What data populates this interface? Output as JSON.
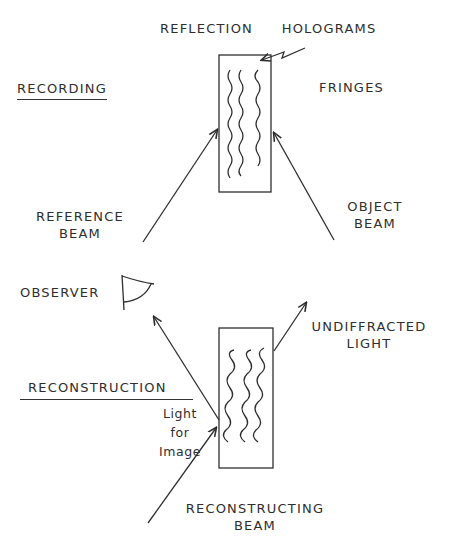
{
  "title": "REFLECTION HOLOGRAMS",
  "title_parts": [
    "REFLECTION",
    "HOLOGRAMS"
  ],
  "recording": {
    "heading": "RECORDING",
    "fringes_label": "FRINGES",
    "reference_beam": [
      "REFERENCE",
      "BEAM"
    ],
    "object_beam": [
      "OBJECT",
      "BEAM"
    ]
  },
  "reconstruction": {
    "heading": "RECONSTRUCTION",
    "observer_label": "OBSERVER",
    "undiffracted_light": [
      "UNDIFFRACTED",
      "LIGHT"
    ],
    "light_for_image": [
      "Light",
      "for",
      "Image"
    ],
    "reconstructing_beam": [
      "RECONSTRUCTING",
      "BEAM"
    ]
  },
  "colors": {
    "ink": "#2e2e2e",
    "background": "#ffffff"
  }
}
